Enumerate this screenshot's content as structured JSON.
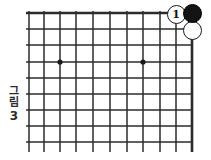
{
  "diagram": {
    "kind": "go-board-diagram",
    "caption": {
      "text_vertical": "그림",
      "char1": "그",
      "char2": "림",
      "number": "3"
    },
    "board": {
      "line_color": "#2b2b2b",
      "border_color": "#1a1a1a",
      "background": "#ffffff",
      "columns": 11,
      "rows": 9,
      "origin_x": 29,
      "origin_y": 13,
      "spacing": 16.3,
      "top_border_thick": true,
      "right_border_thick": true,
      "star_points": [
        {
          "name": "star-point-left",
          "x": 60,
          "y": 62
        },
        {
          "name": "star-point-right",
          "x": 143,
          "y": 62
        }
      ]
    },
    "stones": [
      {
        "name": "white-stone-move-1",
        "color": "white",
        "label": "1",
        "x": 176,
        "y": 14,
        "diameter": 19
      },
      {
        "name": "black-stone-corner",
        "color": "black",
        "label": "",
        "x": 192,
        "y": 13,
        "diameter": 19
      },
      {
        "name": "white-stone-below-corner",
        "color": "white",
        "label": "",
        "x": 192,
        "y": 30,
        "diameter": 19
      }
    ]
  }
}
